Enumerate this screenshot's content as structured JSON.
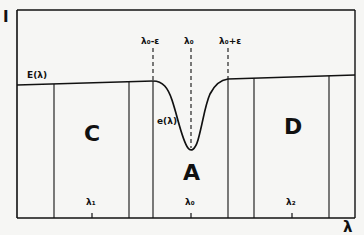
{
  "diagram": {
    "y_axis_label": "I",
    "x_axis_label": "λ",
    "curve_label_continuum": "E(λ)",
    "curve_label_line": "e(λ)",
    "top_markers": {
      "left": "λ₀-ε",
      "center": "λ₀",
      "right": "λ₀+ε"
    },
    "regions": {
      "left": "C",
      "center": "A",
      "right": "D"
    },
    "x_ticks": [
      "λ₁",
      "λ₀",
      "λ₂"
    ],
    "colors": {
      "ink": "#111111",
      "paper": "#f6f6f4"
    }
  }
}
